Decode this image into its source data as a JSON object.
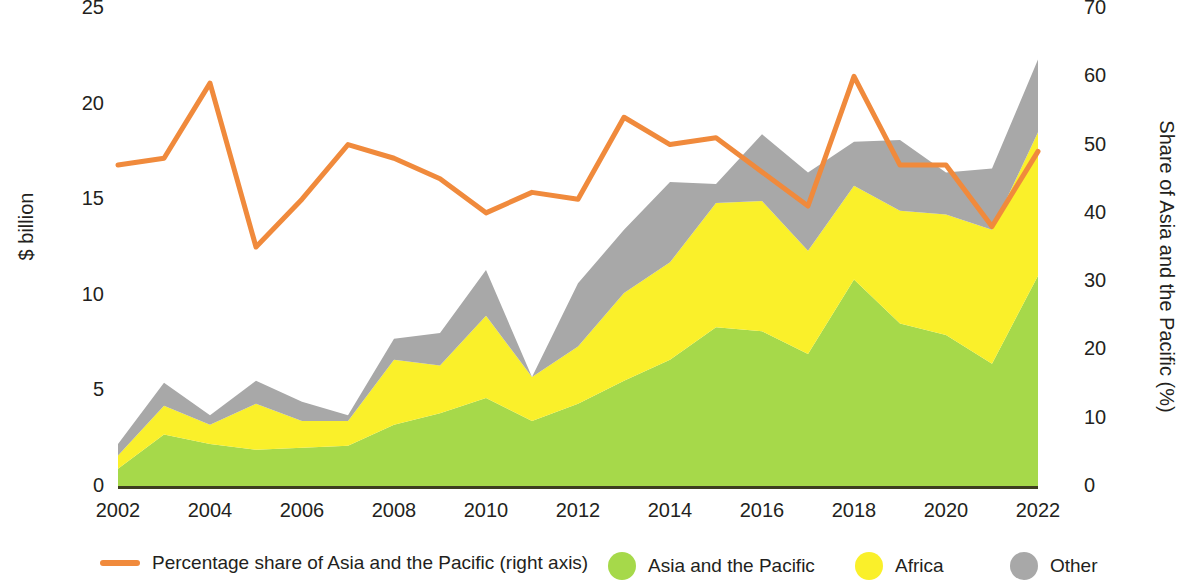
{
  "chart_data": {
    "type": "area",
    "title": "",
    "subtitle": "",
    "xlabel": "",
    "ylabel": "$ billion",
    "y2label": "Share of Asia and the Pacific (%)",
    "grid": false,
    "legend_position": "bottom",
    "ylim": [
      0,
      25
    ],
    "y2lim": [
      0,
      70
    ],
    "xlim": [
      2002,
      2022
    ],
    "yticks": [
      "0",
      "5",
      "10",
      "15",
      "20",
      "25"
    ],
    "ytick_values": [
      0,
      5,
      10,
      15,
      20,
      25
    ],
    "y2ticks": [
      "0",
      "10",
      "20",
      "30",
      "40",
      "50",
      "60",
      "70"
    ],
    "y2tick_values": [
      0,
      10,
      20,
      30,
      40,
      50,
      60,
      70
    ],
    "xticks": [
      "2002",
      "2004",
      "2006",
      "2008",
      "2010",
      "2012",
      "2014",
      "2016",
      "2018",
      "2020",
      "2022"
    ],
    "xtick_values": [
      2002,
      2004,
      2006,
      2008,
      2010,
      2012,
      2014,
      2016,
      2018,
      2020,
      2022
    ],
    "x": [
      2002,
      2003,
      2004,
      2005,
      2006,
      2007,
      2008,
      2009,
      2010,
      2011,
      2012,
      2013,
      2014,
      2015,
      2016,
      2017,
      2018,
      2019,
      2020,
      2021,
      2022
    ],
    "stacked_series": [
      {
        "name": "Asia and the Pacific",
        "color": "#A6D94A",
        "axis": "left",
        "values": [
          0.9,
          2.7,
          2.2,
          1.9,
          2.0,
          2.1,
          3.2,
          3.8,
          4.6,
          3.4,
          4.3,
          5.5,
          6.6,
          8.3,
          8.1,
          6.9,
          10.8,
          8.5,
          7.9,
          6.4,
          11.0
        ]
      },
      {
        "name": "Africa",
        "color": "#FAF02A",
        "axis": "left",
        "values": [
          0.7,
          1.5,
          1.0,
          2.4,
          1.4,
          1.3,
          3.4,
          2.5,
          4.3,
          2.3,
          3.0,
          4.6,
          5.1,
          6.5,
          6.8,
          5.4,
          4.9,
          5.9,
          6.3,
          7.0,
          7.5
        ]
      },
      {
        "name": "Other",
        "color": "#A8A8A8",
        "axis": "left",
        "values": [
          0.6,
          1.2,
          0.5,
          1.2,
          1.0,
          0.3,
          1.1,
          1.7,
          2.4,
          0.0,
          3.3,
          3.3,
          4.2,
          1.0,
          3.5,
          4.1,
          2.3,
          3.7,
          2.2,
          3.2,
          3.8
        ]
      }
    ],
    "line_series": [
      {
        "name": "Percentage share of Asia and the Pacific (right axis)",
        "color": "#F08A3C",
        "axis": "right",
        "values": [
          47,
          48,
          59,
          35,
          42,
          50,
          48,
          45,
          40,
          43,
          42,
          54,
          50,
          51,
          46,
          41,
          60,
          47,
          47,
          38,
          49
        ]
      }
    ],
    "legend": [
      {
        "label": "Percentage share of Asia and the Pacific (right axis)",
        "color": "#F08A3C",
        "marker": "line"
      },
      {
        "label": "Asia and the Pacific",
        "color": "#A6D94A",
        "marker": "dot"
      },
      {
        "label": "Africa",
        "color": "#FAF02A",
        "marker": "dot"
      },
      {
        "label": "Other",
        "color": "#A8A8A8",
        "marker": "dot"
      }
    ],
    "axis_color": "#3d3d1f",
    "text_color": "#231f20"
  }
}
